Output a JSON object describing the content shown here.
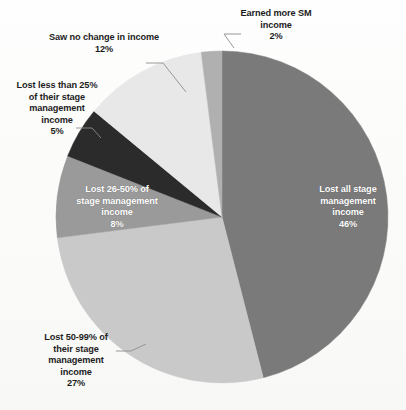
{
  "chart_data": {
    "type": "pie",
    "title": "",
    "subtitle": "",
    "xlabel": "",
    "ylabel": "",
    "legend": "none",
    "grid": false,
    "units": "percent",
    "start_angle_deg": 0,
    "direction": "clockwise",
    "categories": [
      "Lost all stage management income",
      "Lost 50-99% of their stage management income",
      "Lost 26-50% of stage management income",
      "Lost less than 25% of their stage management income",
      "Saw no change in income",
      "Earned more SM income"
    ],
    "values": [
      46,
      27,
      8,
      5,
      12,
      2
    ],
    "slices": [
      {
        "key": "lost-all",
        "label": "Lost all stage\nmanagement\nincome",
        "percent_text": "46%",
        "value": 46,
        "color": "#7a7a7a",
        "label_placement": "inside",
        "label_color": "#ffffff",
        "leader_line": false
      },
      {
        "key": "lost-50-99",
        "label": "Lost 50-99% of\ntheir stage\nmanagement\nincome",
        "percent_text": "27%",
        "value": 27,
        "color": "#c9c9c9",
        "label_placement": "outside",
        "label_color": "#1d1d1d",
        "leader_line": true
      },
      {
        "key": "lost-26-50",
        "label": "Lost 26-50% of\nstage management\nincome",
        "percent_text": "8%",
        "value": 8,
        "color": "#9a9a9a",
        "label_placement": "inside",
        "label_color": "#ffffff",
        "leader_line": false
      },
      {
        "key": "lost-less-25",
        "label": "Lost less than 25%\nof their stage\nmanagement\nincome",
        "percent_text": "5%",
        "value": 5,
        "color": "#2b2b2b",
        "label_placement": "outside",
        "label_color": "#1d1d1d",
        "leader_line": true
      },
      {
        "key": "no-change",
        "label": "Saw no change in income",
        "percent_text": "12%",
        "value": 12,
        "color": "#e8e8e8",
        "label_placement": "outside",
        "label_color": "#1d1d1d",
        "leader_line": true
      },
      {
        "key": "earned-more",
        "label": "Earned more SM\nincome",
        "percent_text": "2%",
        "value": 2,
        "color": "#b0b0b0",
        "label_placement": "outside",
        "label_color": "#1d1d1d",
        "leader_line": true
      }
    ]
  },
  "labels": {
    "earned_more": "Earned more SM\nincome\n2%",
    "no_change": "Saw no change in income\n12%",
    "less_25": "Lost less than 25%\nof their stage\nmanagement\nincome\n5%",
    "lost_26_50": "Lost 26-50% of\nstage management\nincome\n8%",
    "lost_50_99": "Lost 50-99% of\ntheir stage\nmanagement\nincome\n27%",
    "lost_all": "Lost all stage\nmanagement\nincome\n46%"
  },
  "colors": {
    "background": "#fdfdfb",
    "text": "#1d1d1d",
    "inside_text": "#ffffff",
    "leader": "#8d8d8d"
  }
}
